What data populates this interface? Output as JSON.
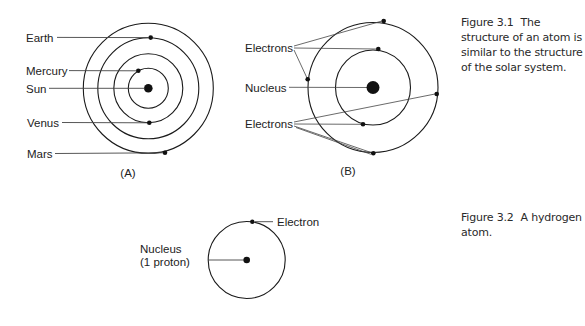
{
  "figure_3_1": {
    "panel_a": {
      "label": "(A)",
      "labels": {
        "earth": "Earth",
        "mercury": "Mercury",
        "sun": "Sun",
        "venus": "Venus",
        "mars": "Mars"
      }
    },
    "panel_b": {
      "label": "(B)",
      "labels": {
        "electrons_top": "Electrons",
        "nucleus": "Nucleus",
        "electrons_bottom": "Electrons"
      }
    },
    "caption": {
      "number": "Figure 3.1",
      "text": "The structure of an atom is similar to the structure of the solar system."
    }
  },
  "figure_3_2": {
    "labels": {
      "electron": "Electron",
      "nucleus_line1": "Nucleus",
      "nucleus_line2": "(1 proton)"
    },
    "caption": {
      "number": "Figure 3.2",
      "text": "A hydrogen atom."
    }
  },
  "colors": {
    "line": "#1a1a1a",
    "text": "#222222"
  }
}
